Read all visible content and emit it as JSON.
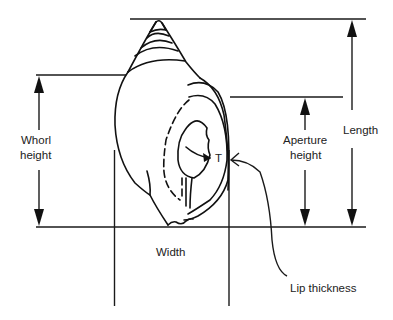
{
  "figure": {
    "labels": {
      "whorl_height_line1": "Whorl",
      "whorl_height_line2": "height",
      "aperture_height_line1": "Aperture",
      "aperture_height_line2": "height",
      "length": "Length",
      "width": "Width",
      "lip_thickness": "Lip thickness",
      "lip_marker": "T"
    },
    "colors": {
      "line": "#1a1a1a",
      "background": "#ffffff"
    }
  }
}
